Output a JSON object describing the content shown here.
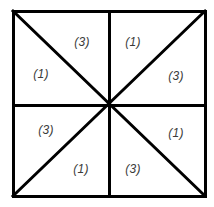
{
  "figure": {
    "name": "square-eight-triangles-diagram",
    "background_color": "#ffffff",
    "stroke_color": "#000000",
    "label_color": "#3a3a3a",
    "square": {
      "left": 13,
      "top": 11,
      "right": 205,
      "bottom": 196,
      "border_width": 3
    },
    "center": {
      "x": 109,
      "y": 105
    },
    "lines": {
      "outer_border_width": 3,
      "median_width": 3,
      "diagonal_width": 3
    }
  },
  "regions": [
    {
      "id": "top-left-upper",
      "label": "(3)",
      "value": 3,
      "x": 82,
      "y": 42,
      "quadrant": "top-left",
      "position": "upper-right-of-diagonal"
    },
    {
      "id": "top-right-upper",
      "label": "(1)",
      "value": 1,
      "x": 133,
      "y": 42,
      "quadrant": "top-right",
      "position": "upper-left-of-diagonal"
    },
    {
      "id": "top-left-lower",
      "label": "(1)",
      "value": 1,
      "x": 41,
      "y": 74,
      "quadrant": "top-left",
      "position": "lower-left-of-diagonal"
    },
    {
      "id": "top-right-lower",
      "label": "(3)",
      "value": 3,
      "x": 176,
      "y": 76,
      "quadrant": "top-right",
      "position": "lower-right-of-diagonal"
    },
    {
      "id": "bottom-left-upper",
      "label": "(3)",
      "value": 3,
      "x": 46,
      "y": 130,
      "quadrant": "bottom-left",
      "position": "upper-left-of-diagonal"
    },
    {
      "id": "bottom-right-upper",
      "label": "(1)",
      "value": 1,
      "x": 176,
      "y": 133,
      "quadrant": "bottom-right",
      "position": "upper-right-of-diagonal"
    },
    {
      "id": "bottom-left-lower",
      "label": "(1)",
      "value": 1,
      "x": 81,
      "y": 169,
      "quadrant": "bottom-left",
      "position": "lower-right-of-diagonal"
    },
    {
      "id": "bottom-right-lower",
      "label": "(3)",
      "value": 3,
      "x": 133,
      "y": 169,
      "quadrant": "bottom-right",
      "position": "lower-left-of-diagonal"
    }
  ]
}
